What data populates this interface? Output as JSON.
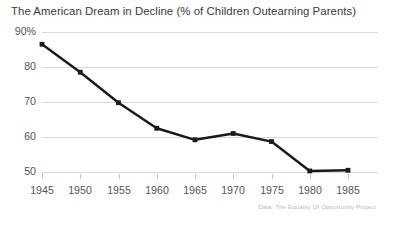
{
  "chart_data": {
    "type": "line",
    "title": "The American Dream in Decline (% of Children Outearning Parents)",
    "xlabel": "",
    "ylabel": "",
    "source_note": "Data: The Equality Of Opportunity Project",
    "x": [
      1945,
      1950,
      1955,
      1960,
      1965,
      1970,
      1975,
      1980,
      1985
    ],
    "categories": [
      "1945",
      "1950",
      "1955",
      "1960",
      "1965",
      "1970",
      "1975",
      "1980",
      "1985"
    ],
    "values": [
      86.5,
      78.5,
      69.8,
      62.5,
      59.2,
      61.0,
      58.7,
      50.3,
      50.5
    ],
    "series": [
      {
        "name": "% of Children Outearning Parents",
        "values": [
          86.5,
          78.5,
          69.8,
          62.5,
          59.2,
          61.0,
          58.7,
          50.3,
          50.5
        ],
        "color": "#1a1a1a",
        "marker": "square"
      }
    ],
    "ylim": [
      45,
      92
    ],
    "xlim": [
      1943,
      1987
    ],
    "yticks": [
      50,
      60,
      70,
      80,
      90
    ],
    "ytick_labels": [
      "50",
      "60",
      "70",
      "80",
      "90%"
    ],
    "xticks": [
      1945,
      1950,
      1955,
      1960,
      1965,
      1970,
      1975,
      1980,
      1985
    ],
    "grid": true,
    "grid_axis": "y",
    "grid_color": "#d8d8d8",
    "legend": false,
    "legend_position": "none",
    "background": "#ffffff",
    "title_color": "#3b3b3b",
    "tick_color": "#555555",
    "line_color": "#1a1a1a",
    "line_width": 2.4
  }
}
